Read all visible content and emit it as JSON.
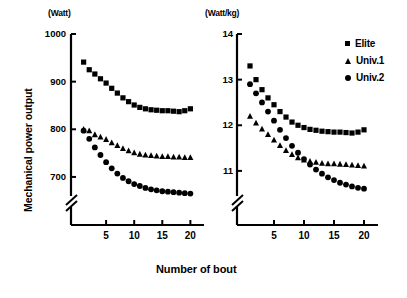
{
  "figure": {
    "y_axis_title": "Mechanical power output",
    "x_axis_title": "Number of bout"
  },
  "legend": {
    "position": "top-right",
    "items": [
      {
        "label": "Elite",
        "marker": "square-marker-icon"
      },
      {
        "label": "Univ.1",
        "marker": "triangle-marker-icon"
      },
      {
        "label": "Univ.2",
        "marker": "circle-marker-icon"
      }
    ]
  },
  "chart_data": [
    {
      "type": "scatter",
      "panel": "left",
      "title": "",
      "unit_label": "(Watt)",
      "xlabel": "Number of bout",
      "ylabel": "Mechanical power output",
      "xlim": [
        0,
        21.5
      ],
      "ylim": [
        660,
        1000
      ],
      "axis_break": true,
      "axis_break_below": 700,
      "grid": false,
      "yticks": [
        700,
        800,
        900,
        1000
      ],
      "ytick_labels": [
        "700",
        "800",
        "900",
        "1000"
      ],
      "xticks": [
        5,
        10,
        15,
        20
      ],
      "xtick_labels": [
        "5",
        "10",
        "15",
        "20"
      ],
      "x": [
        1,
        2,
        3,
        4,
        5,
        6,
        7,
        8,
        9,
        10,
        11,
        12,
        13,
        14,
        15,
        16,
        17,
        18,
        19,
        20
      ],
      "series": [
        {
          "name": "Elite",
          "marker": "square",
          "values": [
            941,
            925,
            916,
            906,
            897,
            886,
            876,
            866,
            858,
            851,
            846,
            843,
            841,
            840,
            839,
            839,
            838,
            837,
            839,
            843
          ]
        },
        {
          "name": "Univ.1",
          "marker": "triangle",
          "values": [
            800,
            797,
            789,
            784,
            779,
            772,
            766,
            760,
            755,
            751,
            748,
            746,
            745,
            744,
            743,
            743,
            742,
            742,
            741,
            741
          ]
        },
        {
          "name": "Univ.2",
          "marker": "circle",
          "values": [
            797,
            780,
            762,
            746,
            731,
            718,
            707,
            698,
            691,
            685,
            681,
            677,
            674,
            672,
            670,
            669,
            668,
            667,
            666,
            665
          ]
        }
      ]
    },
    {
      "type": "scatter",
      "panel": "right",
      "title": "",
      "unit_label": "(Watt/kg)",
      "xlabel": "Number of bout",
      "ylabel": "Mechanical power output",
      "xlim": [
        0,
        21.5
      ],
      "ylim": [
        10.45,
        14.0
      ],
      "axis_break": true,
      "axis_break_below": 11.0,
      "grid": false,
      "yticks": [
        11,
        12,
        13,
        14
      ],
      "ytick_labels": [
        "11",
        "12",
        "13",
        "14"
      ],
      "xticks": [
        5,
        10,
        15,
        20
      ],
      "xtick_labels": [
        "5",
        "10",
        "15",
        "20"
      ],
      "x": [
        1,
        2,
        3,
        4,
        5,
        6,
        7,
        8,
        9,
        10,
        11,
        12,
        13,
        14,
        15,
        16,
        17,
        18,
        19,
        20
      ],
      "series": [
        {
          "name": "Elite",
          "marker": "square",
          "values": [
            13.3,
            13.0,
            12.78,
            12.6,
            12.45,
            12.3,
            12.18,
            12.07,
            12.0,
            11.95,
            11.91,
            11.89,
            11.87,
            11.86,
            11.85,
            11.85,
            11.84,
            11.83,
            11.85,
            11.9
          ]
        },
        {
          "name": "Univ.1",
          "marker": "triangle",
          "values": [
            12.2,
            12.05,
            11.92,
            11.8,
            11.68,
            11.56,
            11.45,
            11.36,
            11.29,
            11.24,
            11.21,
            11.19,
            11.17,
            11.16,
            11.16,
            11.15,
            11.14,
            11.13,
            11.12,
            11.11
          ]
        },
        {
          "name": "Univ.2",
          "marker": "circle",
          "values": [
            12.9,
            12.7,
            12.5,
            12.3,
            12.1,
            11.9,
            11.72,
            11.55,
            11.4,
            11.26,
            11.14,
            11.03,
            10.94,
            10.86,
            10.8,
            10.74,
            10.7,
            10.66,
            10.63,
            10.61
          ]
        }
      ]
    }
  ]
}
